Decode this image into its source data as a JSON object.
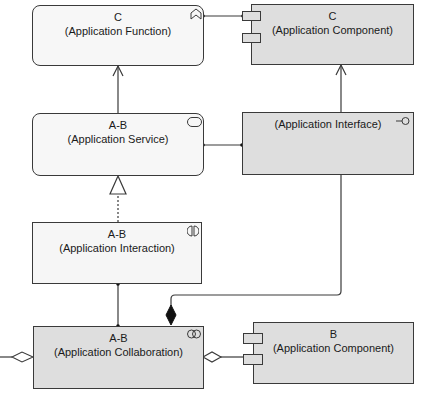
{
  "diagram": {
    "type": "ArchiMate application layer view",
    "colors": {
      "border": "#3a3a3a",
      "light_fill": "#f7f7f7",
      "shaded_fill": "#dedede",
      "line": "#3a3a3a"
    },
    "nodes": {
      "app_function": {
        "name": "C",
        "type_label": "(Application Function)",
        "icon": "function-icon"
      },
      "app_component_c": {
        "name": "C",
        "type_label": "(Application Component)",
        "icon": "component-icon"
      },
      "app_service": {
        "name": "A-B",
        "type_label": "(Application Service)",
        "icon": "service-icon"
      },
      "app_interface": {
        "name": "",
        "type_label": "(Application Interface)",
        "icon": "interface-icon"
      },
      "app_interaction": {
        "name": "A-B",
        "type_label": "(Application Interaction)",
        "icon": "interaction-icon"
      },
      "app_collaboration": {
        "name": "A-B",
        "type_label": "(Application Collaboration)",
        "icon": "collaboration-icon"
      },
      "app_component_b": {
        "name": "B",
        "type_label": "(Application Component)",
        "icon": "component-icon"
      }
    },
    "relationships": [
      {
        "from": "app_service",
        "to": "app_function",
        "kind": "serving"
      },
      {
        "from": "app_component_c",
        "to": "app_function",
        "kind": "assignment"
      },
      {
        "from": "app_interface",
        "to": "app_component_c",
        "kind": "serving"
      },
      {
        "from": "app_interface",
        "to": "app_service",
        "kind": "assignment"
      },
      {
        "from": "app_interaction",
        "to": "app_service",
        "kind": "realization"
      },
      {
        "from": "app_collaboration",
        "to": "app_interaction",
        "kind": "assignment"
      },
      {
        "from": "app_interface",
        "to": "app_collaboration",
        "kind": "composition"
      },
      {
        "from": "app_component_b",
        "to": "app_collaboration",
        "kind": "aggregation"
      },
      {
        "from": "offscreen_left",
        "to": "app_collaboration",
        "kind": "aggregation"
      }
    ]
  }
}
